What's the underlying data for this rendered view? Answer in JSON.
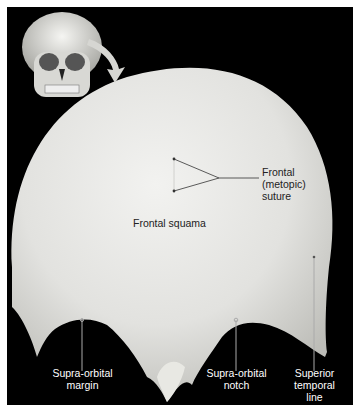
{
  "figure": {
    "inset": "skull-anterior-view-with-frontal-bone-highlighted",
    "labels": {
      "frontal_suture": [
        "Frontal",
        "(metopic)",
        "suture"
      ],
      "frontal_squama": "Frontal squama",
      "supraorbital_margin": [
        "Supra-orbital",
        "margin"
      ],
      "supraorbital_notch": [
        "Supra-orbital",
        "notch"
      ],
      "superior_temporal_line": [
        "Superior",
        "temporal",
        "line"
      ]
    }
  }
}
